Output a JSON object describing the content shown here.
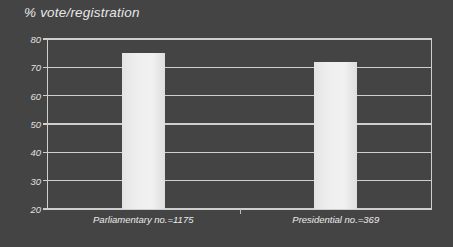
{
  "chart_data": {
    "type": "bar",
    "title": "% vote/registration",
    "xlabel": "",
    "ylabel": "",
    "categories": [
      "Parliamentary no.=1175",
      "Presidential no.=369"
    ],
    "values": [
      75,
      72
    ],
    "series": [
      {
        "name": "% vote/registration",
        "values": [
          75,
          72
        ]
      }
    ],
    "ylim": [
      20,
      80
    ],
    "yticks": [
      20,
      30,
      40,
      50,
      60,
      70,
      80
    ],
    "ytick_labels": [
      "20",
      "30",
      "40",
      "50",
      "60",
      "70",
      "80"
    ],
    "grid": true,
    "legend": false,
    "legend_position": "none",
    "colors": {
      "background": "#444444",
      "bar_fill": "#eeeeee",
      "axis": "#cfcfcf",
      "grid": "#cfcfcf",
      "text": "#e8e8e8"
    }
  },
  "axis": {
    "ticks": [
      {
        "label": "80",
        "value": 80
      },
      {
        "label": "70",
        "value": 70
      },
      {
        "label": "60",
        "value": 60
      },
      {
        "label": "50",
        "value": 50
      },
      {
        "label": "40",
        "value": 40
      },
      {
        "label": "30",
        "value": 30
      },
      {
        "label": "20",
        "value": 20
      }
    ]
  },
  "bars": [
    {
      "label": "Parliamentary no.=1175",
      "value": 75
    },
    {
      "label": "Presidential no.=369",
      "value": 72
    }
  ]
}
